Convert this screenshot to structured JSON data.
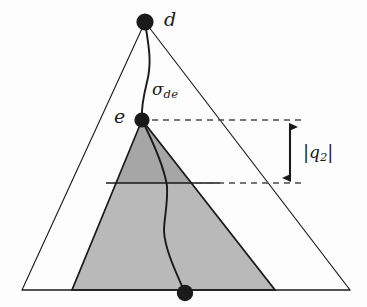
{
  "figure": {
    "background_color": "#fdfdfd",
    "stroke_color": "#1a1a1a"
  },
  "labels": {
    "vertex_d": "d",
    "vertex_e": "e",
    "geodesic_sigma": "σ",
    "geodesic_sigma_subscript": "de",
    "q2_open_bar": "|",
    "q2_symbol": "q",
    "q2_subscript": "2",
    "q2_close_bar": "|"
  },
  "geometry": {
    "outer_triangle": {
      "apex": [
        145,
        22
      ],
      "base_left": [
        22,
        290
      ],
      "base_right": [
        350,
        290
      ],
      "fill": "none",
      "stroke": "#1a1a1a",
      "stroke_width": 1.1
    },
    "inner_triangle": {
      "apex": [
        142,
        120
      ],
      "base_left": [
        72,
        290
      ],
      "base_right": [
        275,
        290
      ],
      "fill_upper": "#a6a6a6",
      "fill_lower": "#b9b9b9",
      "stroke": "#1a1a1a",
      "stroke_width": 1.6,
      "divider_y": 183
    },
    "points": [
      {
        "name": "d",
        "cx": 145,
        "cy": 22,
        "r": 8.5
      },
      {
        "name": "e",
        "cx": 142,
        "cy": 120,
        "r": 7.5
      },
      {
        "name": "path-end",
        "cx": 185,
        "cy": 293,
        "r": 8.0
      }
    ],
    "dashed_line_upper": {
      "x1": 152,
      "y1": 120,
      "x2": 303,
      "y2": 120
    },
    "dashed_line_lower": {
      "x1": 196,
      "y1": 183,
      "x2": 305,
      "y2": 183
    },
    "measure_arrow": {
      "x": 290,
      "y_top": 122,
      "y_bottom": 183
    }
  },
  "colors": {
    "ink": "#1a1a1a",
    "shade_dark": "#a6a6a6",
    "shade_light": "#b9b9b9",
    "paper": "#fdfdfd"
  }
}
